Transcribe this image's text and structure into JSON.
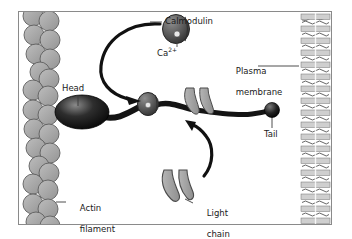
{
  "figure": {
    "type": "biology-diagram",
    "background_color": "#ffffff",
    "frame_border_color": "#8a8a8a"
  },
  "labels": {
    "calmodulin": "Calmodulin",
    "calcium_ion": "Ca",
    "calcium_ion_charge": "2+",
    "plasma_membrane_line1": "Plasma",
    "plasma_membrane_line2": "membrane",
    "head": "Head",
    "tail": "Tail",
    "actin_filament_line1": "Actin",
    "actin_filament_line2": "filament",
    "light_chain_line1": "Light",
    "light_chain_line2": "chain"
  },
  "structures": {
    "actin_filament": {
      "name": "actin-filament",
      "description": "Double-stranded helical chain of globular actin monomers",
      "monomer_fill": "#a8a8a8",
      "monomer_stroke": "#5f5f5f",
      "monomer_count": 22
    },
    "myosin_head": {
      "name": "myosin-head",
      "fill_dark": "#1c1c1c",
      "fill_highlight": "#6e6e6e",
      "cx": 82,
      "cy": 112,
      "rx": 26,
      "ry": 16
    },
    "myosin_tail_bead": {
      "name": "myosin-tail-bead",
      "fill": "#1f1f1f",
      "cx": 272,
      "cy": 110,
      "r": 7
    },
    "calmodulin_free": {
      "name": "calmodulin-free",
      "fill": "#575757",
      "stroke": "#2b2b2b",
      "cx": 176,
      "cy": 28,
      "rx": 13,
      "ry": 14,
      "ca_dot_fill": "#e8e8e8"
    },
    "calmodulin_bound": {
      "name": "calmodulin-bound",
      "fill": "#5c5c5c",
      "stroke": "#2b2b2b",
      "cx": 148,
      "cy": 103,
      "rx": 10,
      "ry": 11,
      "ca_dot_fill": "#e6e6e6"
    },
    "light_chains_bound": {
      "name": "light-chains-bound",
      "fill": "#a3a3a3",
      "stroke": "#4a4a4a",
      "count": 2
    },
    "light_chain_free": {
      "name": "light-chain-free",
      "fill": "#a3a3a3",
      "stroke": "#4a4a4a",
      "cx": 172,
      "cy": 185
    },
    "plasma_membrane": {
      "name": "plasma-membrane",
      "description": "Phospholipid bilayer with head groups and wavy fatty acid tails",
      "head_fill": "#cfcfcf",
      "tail_stroke": "#4d4d4d",
      "left": 300,
      "top": 17,
      "width": 30,
      "height": 200,
      "layer_count": 17
    },
    "arrows": [
      {
        "name": "arrow-calmodulin-to-neck",
        "from": "calmodulin-free",
        "to": "myosin-neck",
        "stroke": "#111111"
      },
      {
        "name": "arrow-light-chain-to-neck",
        "from": "light-chain-free",
        "to": "myosin-neck",
        "stroke": "#111111"
      }
    ],
    "myosin_backbone": {
      "name": "myosin-backbone",
      "stroke": "#141414",
      "description": "Thick dark filament running from head through neck to tail bead at membrane"
    }
  }
}
